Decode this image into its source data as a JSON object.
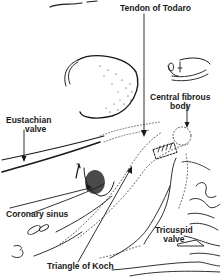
{
  "diagram": {
    "style": "black line drawing on white",
    "colors": {
      "ink": "#1a1a1a",
      "background": "#ffffff"
    },
    "labels": [
      {
        "id": "tendon-of-todaro",
        "text": "Tendon of Todaro",
        "lines": [
          "Tendon of Todaro"
        ]
      },
      {
        "id": "central-fibrous-body",
        "text": "Central fibrous body",
        "lines": [
          "Central fibrous",
          "body"
        ]
      },
      {
        "id": "eustachian-valve",
        "text": "Eustachian valve",
        "lines": [
          "Eustachian",
          "valve"
        ]
      },
      {
        "id": "coronary-sinus",
        "text": "Coronary sinus",
        "lines": [
          "Coronary sinus"
        ]
      },
      {
        "id": "tricuspid-valve",
        "text": "Tricuspid valve",
        "lines": [
          "Tricuspid",
          "valve"
        ]
      },
      {
        "id": "triangle-of-koch",
        "text": "Triangle of Koch",
        "lines": [
          "Triangle of Koch"
        ]
      }
    ]
  }
}
